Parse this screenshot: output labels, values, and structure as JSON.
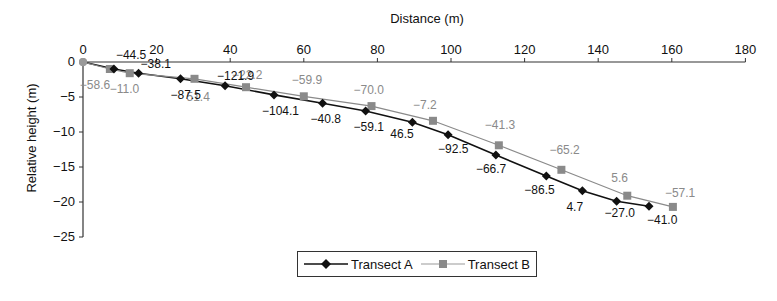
{
  "chart_data": {
    "type": "line",
    "title": "",
    "xlabel": "Distance (m)",
    "ylabel": "Relative height (m)",
    "xlim": [
      0,
      180
    ],
    "ylim": [
      -25,
      0
    ],
    "x_ticks": [
      0,
      20,
      40,
      60,
      80,
      100,
      120,
      140,
      160,
      180
    ],
    "y_ticks": [
      0,
      -5,
      -10,
      -15,
      -20,
      -25
    ],
    "x_axis_position": "top",
    "grid": false,
    "legend_position": "bottom",
    "series": [
      {
        "name": "Transect A",
        "color": "#111111",
        "marker": "diamond",
        "x": [
          0,
          8.4,
          15.1,
          26.5,
          38.6,
          51.9,
          65.1,
          76.8,
          89.5,
          99.2,
          112.2,
          125.9,
          135.7,
          145.0,
          153.8
        ],
        "y": [
          0,
          -1.0,
          -1.6,
          -2.4,
          -3.4,
          -4.7,
          -5.9,
          -7.0,
          -8.6,
          -10.4,
          -13.3,
          -16.3,
          -18.4,
          -19.9,
          -20.6
        ],
        "point_labels": [
          "",
          "−44.5",
          "−38.1",
          "−87.5",
          "−121.9",
          "−104.1",
          "−40.8",
          "−59.1",
          "46.5",
          "−92.5",
          "−66.7",
          "−86.5",
          "4.7",
          "−27.0",
          "−41.0"
        ]
      },
      {
        "name": "Transect B",
        "color": "#8a8a8a",
        "marker": "square",
        "x": [
          0,
          7.3,
          12.7,
          30.3,
          44.3,
          60.0,
          78.4,
          95.1,
          113.0,
          130.0,
          147.9,
          160.3
        ],
        "y": [
          0,
          -1.0,
          -1.6,
          -2.4,
          -3.6,
          -4.9,
          -6.3,
          -8.4,
          -11.9,
          -15.4,
          -19.1,
          -20.7
        ],
        "point_labels": [
          "",
          "−58.6",
          "−11.0",
          "51.4",
          "−22.2",
          "−59.9",
          "−70.0",
          "−7.2",
          "−41.3",
          "−65.2",
          "5.6",
          "−57.1"
        ]
      }
    ]
  },
  "legend": {
    "a_label": "Transect A",
    "b_label": "Transect B"
  }
}
